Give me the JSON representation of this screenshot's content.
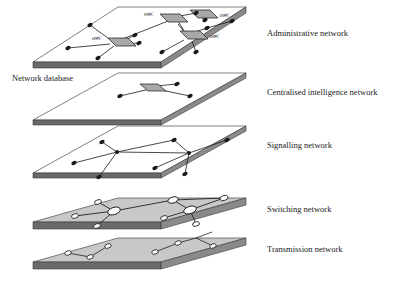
{
  "figure": {
    "background": "#ffffff"
  },
  "colors": {
    "plane_fill_light": "#ffffff",
    "plane_fill_gray": "#c8c8c8",
    "plane_edge_dark": "#585858",
    "plane_edge_mid": "#8a8a8a",
    "outline": "#4a4a4a",
    "link": "#222222",
    "node_dark": "#1a1a1a",
    "node_light": "#ffffff",
    "node_box_fill": "#a8a8a8",
    "text": "#1a1a1a"
  },
  "labels": {
    "network_database": "Network database",
    "layers": [
      {
        "id": "administrative",
        "label": "Administrative network"
      },
      {
        "id": "centralised",
        "label": "Centralised intelligence network"
      },
      {
        "id": "signalling",
        "label": "Signalling network"
      },
      {
        "id": "switching",
        "label": "Switching network"
      },
      {
        "id": "transmission",
        "label": "Transmission network"
      }
    ]
  },
  "layers": [
    {
      "id": "administrative",
      "label": "Administrative network",
      "fill": "light",
      "node_style": "box",
      "centre_tags": [
        "NMC",
        "OMC",
        "OMC",
        "OMC"
      ],
      "centres": 4,
      "terminals": 13
    },
    {
      "id": "centralised",
      "label": "Centralised intelligence network",
      "fill": "light",
      "node_style": "box",
      "centre_tags": [],
      "centres": 1,
      "terminals": 3
    },
    {
      "id": "signalling",
      "label": "Signalling network",
      "fill": "light",
      "node_style": "dark-dot",
      "centre_tags": [],
      "centres": 2,
      "terminals": 7
    },
    {
      "id": "switching",
      "label": "Switching network",
      "fill": "gray",
      "node_style": "white-ellipse",
      "centre_tags": [],
      "centres": 2,
      "terminals": 7
    },
    {
      "id": "transmission",
      "label": "Transmission network",
      "fill": "gray",
      "node_style": "white-ellipse",
      "centre_tags": [],
      "centres": 0,
      "terminals": 6
    }
  ],
  "node_tags": {
    "nmc": "NMC",
    "omc_left": "OMC",
    "omc_top_right": "OMC",
    "omc_mid_right": "OMC"
  }
}
